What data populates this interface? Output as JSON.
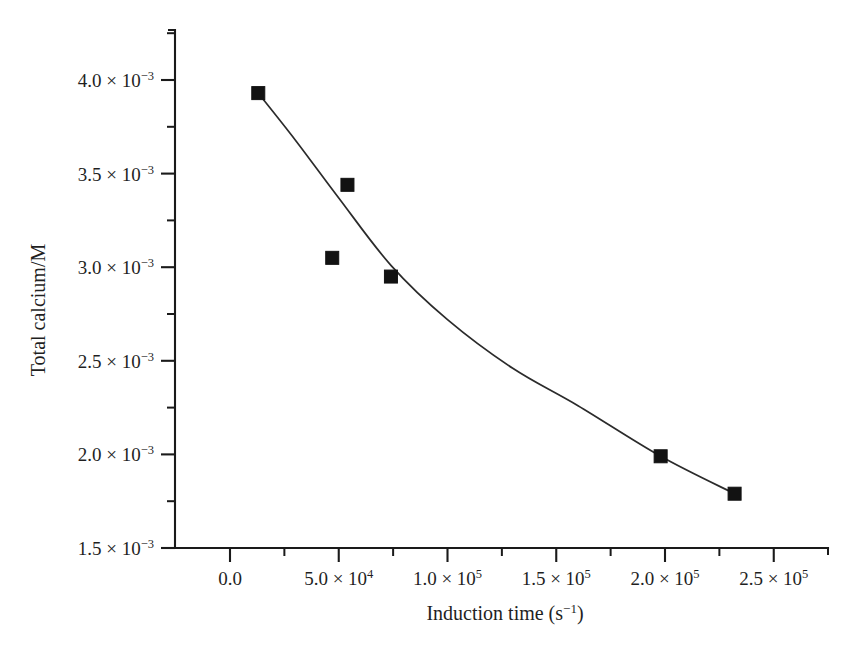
{
  "figure": {
    "background_color": "#ffffff",
    "foreground_color": "#1a1a1a",
    "marker_color": "#121212",
    "curve_color": "#2b2b2b"
  },
  "chart_data": {
    "type": "scatter",
    "title": "",
    "subtitle": "",
    "xlabel": "Induction time (s−1)",
    "xlabel_parts": {
      "base": "Induction time (s",
      "exponent": "−1",
      "tail": ")"
    },
    "ylabel": "Total calcium/M",
    "xlim": [
      -27000,
      272000
    ],
    "ylim": [
      0.0015,
      0.00425
    ],
    "grid": false,
    "legend": null,
    "x_ticks": [
      {
        "value": 0,
        "label": "0.0",
        "mantissa": "0.0",
        "has_power": false
      },
      {
        "value": 50000,
        "label": "5.0 × 10⁴",
        "mantissa": "5.0",
        "exponent": "4"
      },
      {
        "value": 100000,
        "label": "1.0 × 10⁵",
        "mantissa": "1.0",
        "exponent": "5"
      },
      {
        "value": 150000,
        "label": "1.5 × 10⁵",
        "mantissa": "1.5",
        "exponent": "5"
      },
      {
        "value": 200000,
        "label": "2.0 × 10⁵",
        "mantissa": "2.0",
        "exponent": "5"
      },
      {
        "value": 250000,
        "label": "2.5 × 10⁵",
        "mantissa": "2.5",
        "exponent": "5"
      }
    ],
    "x_minor_ticks": [
      25000,
      75000,
      125000,
      175000,
      225000
    ],
    "y_ticks": [
      {
        "value": 0.0015,
        "label": "1.5 × 10⁻³",
        "mantissa": "1.5",
        "exponent": "−3"
      },
      {
        "value": 0.002,
        "label": "2.0 × 10⁻³",
        "mantissa": "2.0",
        "exponent": "−3"
      },
      {
        "value": 0.0025,
        "label": "2.5 × 10⁻³",
        "mantissa": "2.5",
        "exponent": "−3"
      },
      {
        "value": 0.003,
        "label": "3.0 × 10⁻³",
        "mantissa": "3.0",
        "exponent": "−3"
      },
      {
        "value": 0.0035,
        "label": "3.5 × 10⁻³",
        "mantissa": "3.5",
        "exponent": "−3"
      },
      {
        "value": 0.004,
        "label": "4.0 × 10⁻³",
        "mantissa": "4.0",
        "exponent": "−3"
      }
    ],
    "y_minor_ticks": [
      0.00175,
      0.00225,
      0.00275,
      0.00325,
      0.00375,
      0.00425
    ],
    "series": [
      {
        "name": "Total calcium",
        "marker": "filled-square",
        "x": [
          13000,
          54000,
          47000,
          74000,
          198000,
          232000
        ],
        "y": [
          0.00393,
          0.00344,
          0.00305,
          0.00295,
          0.00199,
          0.00179
        ]
      }
    ],
    "fit_curve": {
      "name": "exponential decay fit",
      "x": [
        13000,
        30000,
        50000,
        74000,
        100000,
        130000,
        160000,
        198000,
        232000
      ],
      "y": [
        0.00393,
        0.00368,
        0.00337,
        0.00301,
        0.00272,
        0.00246,
        0.00226,
        0.00199,
        0.00179
      ]
    }
  }
}
